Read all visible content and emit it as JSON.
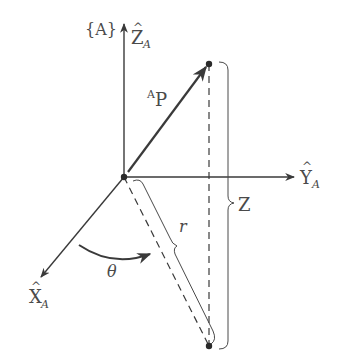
{
  "diagram": {
    "frame_label": "{A}",
    "axes": {
      "z": {
        "letter": "Z",
        "hat": "^",
        "subscript": "A"
      },
      "y": {
        "letter": "Y",
        "hat": "^",
        "subscript": "A"
      },
      "x": {
        "letter": "X",
        "hat": "^",
        "subscript": "A"
      }
    },
    "vector_label": {
      "superscript": "A",
      "main": "P"
    },
    "r_label": "r",
    "z_label": "Z",
    "theta_label": "θ",
    "colors": {
      "line": "#3a3a3a",
      "text": "#4a4a4a",
      "background": "#ffffff"
    }
  }
}
